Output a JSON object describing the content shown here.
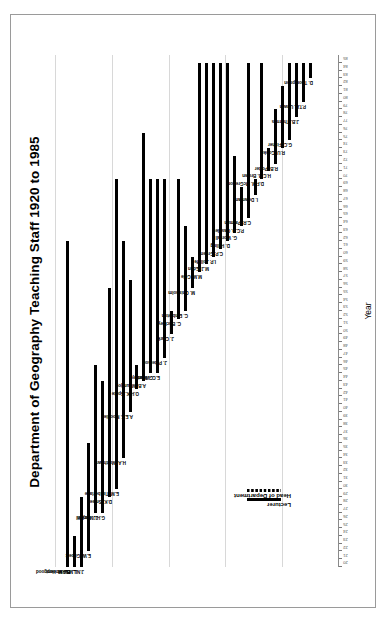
{
  "chart_data": {
    "type": "bar",
    "title": "Department of Geography Teaching Staff 1920 to 1985",
    "xlabel": "Year",
    "ylabel": "",
    "xlim": [
      20,
      86
    ],
    "grid": true,
    "orientation": "rotated-90",
    "legend_position": "inside-lower-left",
    "tick_step": 1,
    "tick_labels": [
      "20",
      "21",
      "22",
      "23",
      "24",
      "25",
      "26",
      "27",
      "28",
      "29",
      "30",
      "31",
      "32",
      "33",
      "34",
      "35",
      "36",
      "37",
      "38",
      "39",
      "40",
      "41",
      "42",
      "43",
      "44",
      "45",
      "46",
      "47",
      "48",
      "49",
      "50",
      "51",
      "52",
      "53",
      "54",
      "55",
      "56",
      "57",
      "58",
      "59",
      "60",
      "61",
      "62",
      "63",
      "64",
      "65",
      "66",
      "67",
      "68",
      "69",
      "70",
      "71",
      "72",
      "73",
      "74",
      "75",
      "76",
      "77",
      "78",
      "79",
      "80",
      "81",
      "82",
      "83",
      "84",
      "85"
    ],
    "series": [
      {
        "name": "Lecturer",
        "style": "solid"
      },
      {
        "name": "Head of Department",
        "style": "dotted"
      }
    ],
    "categories": [
      "B.F.M. Hopgood",
      "L.M.E. Vincent",
      "J.N.L. Baker",
      "E.W. Gilbert",
      "J. Mitchell",
      "G.H.J. Daysh",
      "D.K. Smee",
      "E.M. Timberlake",
      "H.A. Matthews",
      "A.E.F. Moodie",
      "O.H.K. Spate",
      "A.B. Mountjoy",
      "G. Manley",
      "E.C. Willatts",
      "J. Paterson",
      "J. Clark",
      "C. Buckley",
      "C. Embleton",
      "M. Chisholm",
      "M.M. Cole",
      "M.J. Eden",
      "I.P. Jolliffe",
      "C.P. Green",
      "D. Hilling",
      "G. Worrall",
      "P.C.D. Casplet",
      "C.R. Patman",
      "I. Dowman",
      "D.F.M. McGregor",
      "H.C.B. Brown",
      "R.B. Potter",
      "R.U. Cooke",
      "G.C. Fisher",
      "J.B. Thornes",
      "P.T.H. Unwin",
      "D. Thompson"
    ],
    "staff": [
      {
        "name": "B.F.M. Hopgood",
        "start": 20,
        "end": 62,
        "role": "Head of Department"
      },
      {
        "name": "L.M.E. Vincent",
        "start": 20,
        "end": 24,
        "role": "Lecturer"
      },
      {
        "name": "J.N.L. Baker",
        "start": 20,
        "end": 29,
        "role": "Lecturer"
      },
      {
        "name": "E.W. Gilbert",
        "start": 22,
        "end": 36,
        "role": "Lecturer"
      },
      {
        "name": "J. Mitchell",
        "start": 27,
        "end": 46,
        "role": "Lecturer"
      },
      {
        "name": "G.H.J. Daysh",
        "start": 27,
        "end": 44,
        "role": "Lecturer"
      },
      {
        "name": "D.K. Smee",
        "start": 29,
        "end": 56,
        "role": "Lecturer"
      },
      {
        "name": "E.M. Timberlake",
        "start": 30,
        "end": 70,
        "role": "Lecturer"
      },
      {
        "name": "H.A. Matthews",
        "start": 34,
        "end": 62,
        "role": "Lecturer"
      },
      {
        "name": "A.E.F. Moodie",
        "start": 40,
        "end": 57,
        "role": "Lecturer"
      },
      {
        "name": "O.H.K. Spate",
        "start": 43,
        "end": 46,
        "role": "Lecturer"
      },
      {
        "name": "A.B. Mountjoy",
        "start": 44,
        "end": 76,
        "role": "Lecturer"
      },
      {
        "name": "G. Manley",
        "start": 45,
        "end": 70,
        "role": "Head of Department"
      },
      {
        "name": "E.C. Willatts",
        "start": 45,
        "end": 70,
        "role": "Lecturer"
      },
      {
        "name": "J. Paterson",
        "start": 47,
        "end": 70,
        "role": "Lecturer"
      },
      {
        "name": "J. Clark",
        "start": 50,
        "end": 53,
        "role": "Lecturer"
      },
      {
        "name": "C. Buckley",
        "start": 52,
        "end": 70,
        "role": "Lecturer"
      },
      {
        "name": "C. Embleton",
        "start": 53,
        "end": 64,
        "role": "Lecturer"
      },
      {
        "name": "M. Chisholm",
        "start": 56,
        "end": 60,
        "role": "Lecturer"
      },
      {
        "name": "M.M. Cole",
        "start": 58,
        "end": 85,
        "role": "Head of Department"
      },
      {
        "name": "M.J. Eden",
        "start": 59,
        "end": 85,
        "role": "Lecturer"
      },
      {
        "name": "I.P. Jolliffe",
        "start": 60,
        "end": 85,
        "role": "Lecturer"
      },
      {
        "name": "C.P. Green",
        "start": 61,
        "end": 85,
        "role": "Lecturer"
      },
      {
        "name": "D. Hilling",
        "start": 62,
        "end": 85,
        "role": "Lecturer"
      },
      {
        "name": "G. Worrall",
        "start": 63,
        "end": 73,
        "role": "Lecturer"
      },
      {
        "name": "P.C.D. Casplet",
        "start": 64,
        "end": 69,
        "role": "Lecturer"
      },
      {
        "name": "C.R. Patman",
        "start": 65,
        "end": 85,
        "role": "Lecturer"
      },
      {
        "name": "I. Dowman",
        "start": 68,
        "end": 70,
        "role": "Lecturer"
      },
      {
        "name": "D.F.M. McGregor",
        "start": 70,
        "end": 85,
        "role": "Lecturer"
      },
      {
        "name": "H.C.B. Brown",
        "start": 71,
        "end": 74,
        "role": "Lecturer"
      },
      {
        "name": "R.B. Potter",
        "start": 72,
        "end": 79,
        "role": "Lecturer"
      },
      {
        "name": "R.U. Cooke",
        "start": 74,
        "end": 82,
        "role": "Head of Department"
      },
      {
        "name": "G.C. Fisher",
        "start": 75,
        "end": 85,
        "role": "Lecturer"
      },
      {
        "name": "J.B. Thornes",
        "start": 78,
        "end": 85,
        "role": "Head of Department"
      },
      {
        "name": "P.T.H. Unwin",
        "start": 80,
        "end": 85,
        "role": "Lecturer"
      },
      {
        "name": "D. Thompson",
        "start": 83,
        "end": 85,
        "role": "Lecturer"
      }
    ]
  },
  "legend": {
    "lecturer_label": "Lecturer",
    "head_label": "Head of Department"
  },
  "colors": {
    "bar": "#000000",
    "grid": "#d8d8d8",
    "frame": "#9a9a9a",
    "text": "#000000"
  }
}
